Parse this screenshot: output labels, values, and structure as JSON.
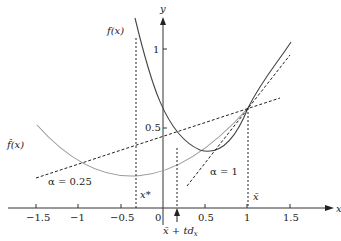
{
  "figure": {
    "axes": {
      "x_label": "x",
      "y_label": "y",
      "x_ticks": [
        "−1.5",
        "−1",
        "−0.5",
        "0",
        "0.5",
        "1",
        "1.5"
      ],
      "y_ticks": [
        "1",
        "0.5"
      ]
    },
    "curves": {
      "f_label": "f(x)",
      "fhat_label": "f̂(x)"
    },
    "lines": {
      "alpha_025_label": "α = 0.25",
      "alpha_1_label": "α = 1"
    },
    "points": {
      "x_star_label": "x*",
      "x_bar_label": "x̄",
      "x_bar_step_label": "x̄ + td",
      "x_bar_step_sub": "x"
    },
    "colors": {
      "axis": "#333333",
      "f_curve": "#444444",
      "fhat_curve": "#999999",
      "dashed": "#222222"
    }
  }
}
